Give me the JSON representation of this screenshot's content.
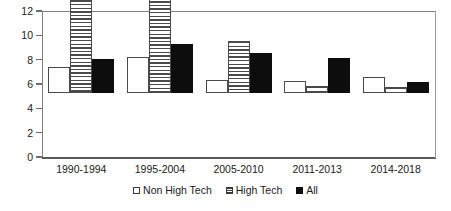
{
  "chart_data": {
    "type": "bar",
    "title": "",
    "xlabel": "",
    "ylabel": "",
    "ylim": [
      0,
      12
    ],
    "yticks": [
      0,
      2,
      4,
      6,
      8,
      10,
      12
    ],
    "grid": false,
    "legend_position": "bottom",
    "categories": [
      "1990-1994",
      "1995-2004",
      "2005-2010",
      "2011-2013",
      "2014-2018"
    ],
    "series": [
      {
        "name": "Non High Tech",
        "style": "white-filled",
        "color": "#ffffff",
        "values": [
          2.1,
          3.0,
          1.1,
          1.0,
          1.3
        ]
      },
      {
        "name": "High Tech",
        "style": "horizontal-hatch",
        "color": "#4a4a4a",
        "values": [
          8.9,
          9.7,
          4.3,
          0.6,
          0.5
        ]
      },
      {
        "name": "All",
        "style": "solid-black",
        "color": "#0d0d0d",
        "values": [
          2.8,
          4.0,
          3.3,
          2.9,
          0.9
        ]
      }
    ]
  },
  "legend": {
    "items": [
      {
        "label": "Non High Tech"
      },
      {
        "label": "High Tech"
      },
      {
        "label": "All"
      }
    ]
  }
}
